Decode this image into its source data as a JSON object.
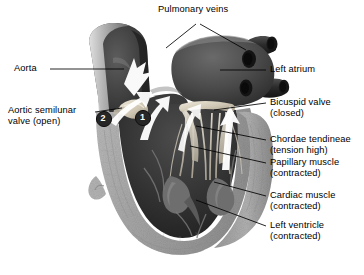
{
  "figure": {
    "view": "frontal coronal section through left side of heart",
    "background_color": "#ffffff",
    "line_color": "#000000",
    "style": "grayscale halftone medical illustration"
  },
  "labels": {
    "pulmonary_veins": "Pulmonary veins",
    "aorta": "Aorta",
    "aortic_semilunar_valve_l1": "Aortic semilunar",
    "aortic_semilunar_valve_l2": "valve (open)",
    "left_atrium": "Left atrium",
    "bicuspid_valve_l1": "Bicuspid valve",
    "bicuspid_valve_l2": "(closed)",
    "chordae_tendineae_l1": "Chordae tendineae",
    "chordae_tendineae_l2": "(tension high)",
    "papillary_muscle_l1": "Papillary muscle",
    "papillary_muscle_l2": "(contracted)",
    "cardiac_muscle_l1": "Cardiac muscle",
    "cardiac_muscle_l2": "(contracted)",
    "left_ventricle_l1": "Left ventricle",
    "left_ventricle_l2": "(contracted)"
  },
  "markers": [
    {
      "id": "marker-1",
      "text": "1",
      "x": 143,
      "y": 118
    },
    {
      "id": "marker-2",
      "text": "2",
      "x": 104,
      "y": 119
    }
  ],
  "flow_arrows": {
    "count": 5,
    "color": "#ffffff",
    "description": "white blood-flow arrows ascending out of the left ventricle through the aortic valve into the aorta"
  },
  "colors": {
    "chamber_dark": "#3a3a3a",
    "atrium_fill": "#555555",
    "myocardium_gray": "#a9a9a9",
    "myocardium_light": "#c3c3c3",
    "valve_cream": "#d8d2c4",
    "vessel_dark": "#2e2e2e",
    "arrow_white": "#ffffff",
    "marker_fill": "#262626",
    "marker_text": "#ffffff"
  }
}
